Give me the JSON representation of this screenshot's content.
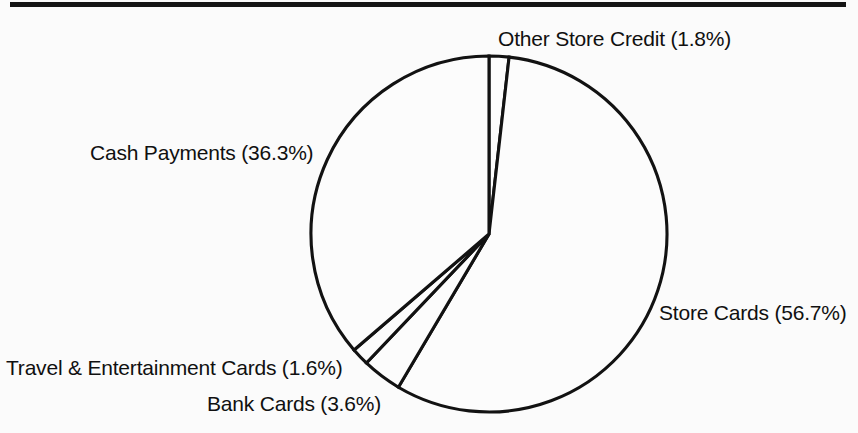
{
  "figure": {
    "background_color": "#fbfbfb",
    "ink_color": "#121212",
    "top_rule": true
  },
  "chart_data": {
    "type": "pie",
    "title": "",
    "subtitle": "",
    "xlabel": "",
    "ylabel": "",
    "legend_position": "none",
    "grid": false,
    "start_angle_deg": 90,
    "direction": "clockwise",
    "center": {
      "x": 489,
      "y": 234
    },
    "radius": 178,
    "fill": "none",
    "categories": [
      "Other Store Credit",
      "Store Cards",
      "Bank Cards",
      "Travel & Entertainment Cards",
      "Cash Payments"
    ],
    "values": [
      1.8,
      56.7,
      3.6,
      1.6,
      36.3
    ],
    "units": "percent",
    "slices": [
      {
        "name": "Other Store Credit",
        "value": 1.8,
        "label": "Other Store Credit (1.8%)",
        "label_position": "top",
        "fill": "none",
        "stroke": "#121212"
      },
      {
        "name": "Store Cards",
        "value": 56.7,
        "label": "Store Cards (56.7%)",
        "label_position": "right",
        "fill": "none",
        "stroke": "#121212"
      },
      {
        "name": "Bank Cards",
        "value": 3.6,
        "label": "Bank Cards (3.6%)",
        "label_position": "bottom-left",
        "fill": "none",
        "stroke": "#121212"
      },
      {
        "name": "Travel & Entertainment Cards",
        "value": 1.6,
        "label": "Travel & Entertainment Cards (1.6%)",
        "label_position": "left-bottom",
        "fill": "none",
        "stroke": "#121212"
      },
      {
        "name": "Cash Payments",
        "value": 36.3,
        "label": "Cash Payments (36.3%)",
        "label_position": "left",
        "fill": "none",
        "stroke": "#121212"
      }
    ]
  }
}
